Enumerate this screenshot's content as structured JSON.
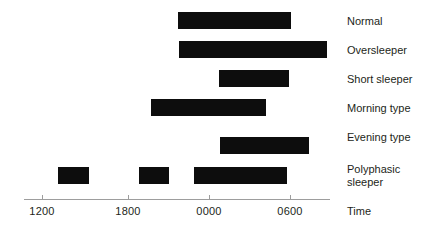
{
  "chart_data": {
    "type": "bar",
    "title": "",
    "xlabel": "Time",
    "ylabel": "",
    "orientation": "horizontal",
    "grid": false,
    "legend": null,
    "xlim": [
      "1000",
      "0800"
    ],
    "xtick_labels": [
      "1200",
      "1800",
      "0000",
      "0600"
    ],
    "xtick_pixels": [
      42,
      128,
      209,
      290
    ],
    "axis_start_px": 24,
    "axis_end_px": 330,
    "bar_color": "#0d0d0d",
    "axis_color": "#9d9d9d",
    "categories": [
      "Normal",
      "Oversleeper",
      "Short sleeper",
      "Morning type",
      "Evening type",
      "Polyphasic sleeper"
    ],
    "rows": [
      {
        "label": "Normal",
        "label_lines": [
          "Normal"
        ],
        "top": 12,
        "label_top": 15,
        "segments": [
          {
            "start_px": 178,
            "end_px": 291,
            "start_time": "2250",
            "end_time": "0700"
          }
        ]
      },
      {
        "label": "Oversleeper",
        "label_lines": [
          "Oversleeper"
        ],
        "top": 41,
        "label_top": 44,
        "segments": [
          {
            "start_px": 179,
            "end_px": 327,
            "start_time": "2300",
            "end_time": "0940"
          }
        ]
      },
      {
        "label": "Short sleeper",
        "label_lines": [
          "Short sleeper"
        ],
        "top": 70,
        "label_top": 73,
        "segments": [
          {
            "start_px": 219,
            "end_px": 289,
            "start_time": "0150",
            "end_time": "0650"
          }
        ]
      },
      {
        "label": "Morning type",
        "label_lines": [
          "Morning type"
        ],
        "top": 99,
        "label_top": 102,
        "segments": [
          {
            "start_px": 151,
            "end_px": 266,
            "start_time": "2030",
            "end_time": "0450"
          }
        ]
      },
      {
        "label": "Evening type",
        "label_lines": [
          "Evening type"
        ],
        "top": 137,
        "label_top": 131,
        "segments": [
          {
            "start_px": 220,
            "end_px": 309,
            "start_time": "0200",
            "end_time": "0820"
          }
        ]
      },
      {
        "label": "Polyphasic sleeper",
        "label_lines": [
          "Polyphasic",
          "sleeper"
        ],
        "top": 167,
        "label_top": 163,
        "segments": [
          {
            "start_px": 58,
            "end_px": 89,
            "start_time": "1330",
            "end_time": "1530"
          },
          {
            "start_px": 139,
            "end_px": 169,
            "start_time": "1920",
            "end_time": "2130"
          },
          {
            "start_px": 194,
            "end_px": 287,
            "start_time": "2340",
            "end_time": "0620"
          }
        ]
      }
    ]
  },
  "axis": {
    "title": "Time"
  }
}
